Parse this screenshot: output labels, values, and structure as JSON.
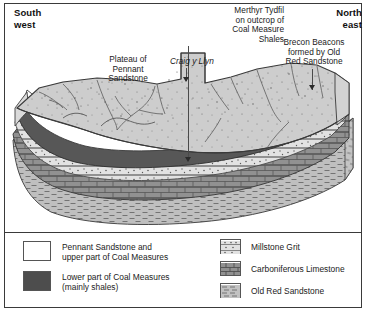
{
  "figure": {
    "type": "geological-cross-section",
    "orientation_labels": {
      "left": "South\nwest",
      "left_line1": "South",
      "left_line2": "west",
      "right_line1": "North",
      "right_line2": "east"
    },
    "annotations": [
      {
        "id": "merthyr",
        "text": "Merthyr Tydfil\non outcrop of\nCoal Measure\nShales",
        "align": "right",
        "has_leader_line": true,
        "has_arrowhead": true
      },
      {
        "id": "brecon",
        "text": "Brecon Beacons\nformed by Old\nRed Sandstone",
        "align": "center",
        "has_leader_line": true,
        "has_arrowhead": true
      },
      {
        "id": "plateau",
        "text": "Plateau of\nPennant\nSandstone",
        "align": "center",
        "has_leader_line": false,
        "has_arrowhead": false
      },
      {
        "id": "craig",
        "text": "Craig y Llyn",
        "style": "italic",
        "has_leader_line": true,
        "has_arrowhead": true
      }
    ]
  },
  "legend": {
    "left_column": [
      {
        "label": "Pennant Sandstone and\nupper part of Coal Measures",
        "label_line1": "Pennant Sandstone and",
        "label_line2": "upper part of Coal Measures",
        "swatch": "white-fill",
        "color": "#ffffff"
      },
      {
        "label": "Lower part of Coal Measures\n(mainly shales)",
        "label_line1": "Lower part of Coal Measures",
        "label_line2": "(mainly shales)",
        "swatch": "solid-dark-fill",
        "color": "#4d4d4d"
      }
    ],
    "right_column": [
      {
        "label": "Millstone Grit",
        "swatch": "dotted-banded-pattern",
        "color": "#d7d7d7"
      },
      {
        "label": "Carboniferous Limestone",
        "swatch": "brick-pattern",
        "color": "#8a8a8a"
      },
      {
        "label": "Old Red Sandstone",
        "swatch": "dashed-pattern",
        "color": "#b9b9b9"
      }
    ]
  },
  "strata_colors": {
    "pennant_sandstone_top": "#cfcfcf",
    "pennant_side": "#dcdcdc",
    "white_band": "#ffffff",
    "lower_coal_measures": "#595959",
    "millstone_grit": "#e0e0e0",
    "carboniferous_limestone": "#8f8f8f",
    "old_red_sandstone": "#bdbdbd",
    "outline": "#3a3a3a",
    "frame_border": "#3a3a3a"
  }
}
